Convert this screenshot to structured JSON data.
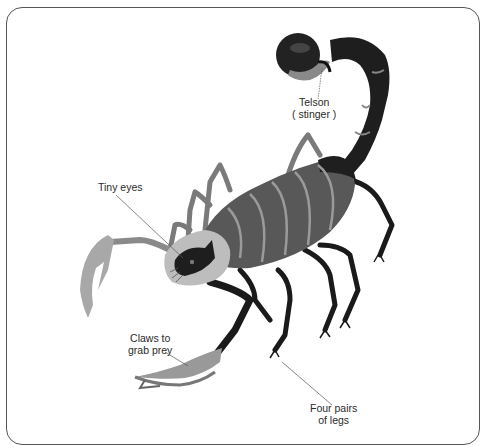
{
  "diagram": {
    "labels": {
      "telson_line1": "Telson",
      "telson_line2": "( stinger )",
      "eyes": "Tiny eyes",
      "claws_line1": "Claws to",
      "claws_line2": "grab prey",
      "legs_line1": "Four pairs",
      "legs_line2": "of legs"
    },
    "colors": {
      "frame_border": "#555555",
      "body_dark": "#1e1e1e",
      "body_mid": "#555555",
      "body_light": "#9a9a9a",
      "label_text": "#2a2a2a"
    }
  }
}
